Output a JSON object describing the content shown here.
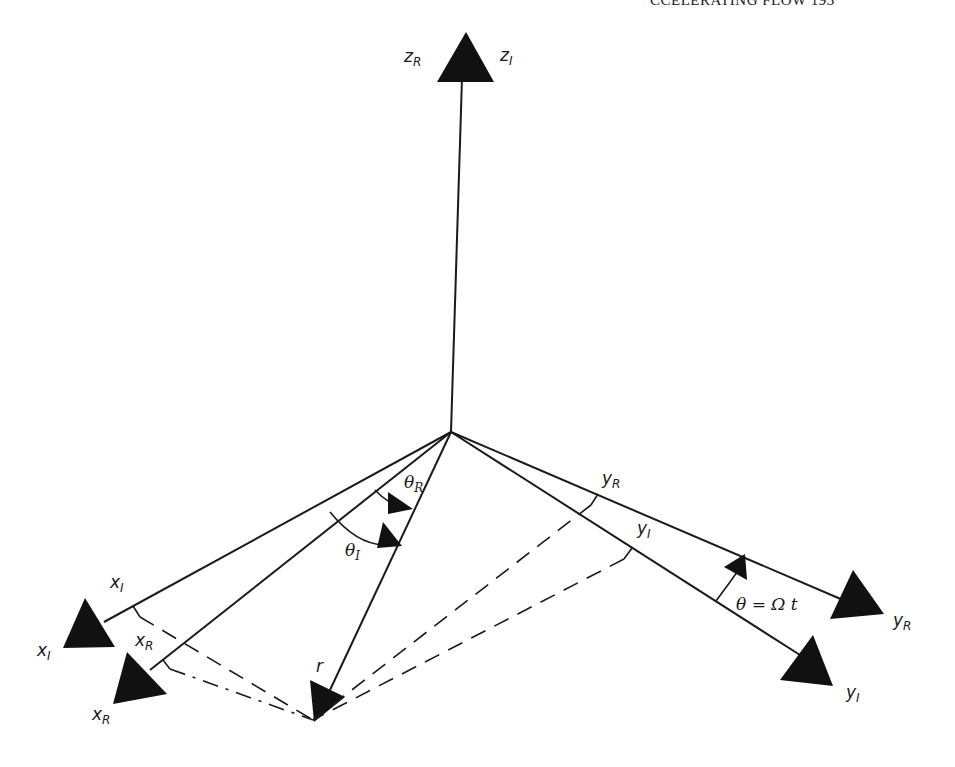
{
  "page_header": "CCELERATING FLOW 193",
  "labels": {
    "z_R": {
      "base": "z",
      "sub": "R"
    },
    "z_I": {
      "base": "z",
      "sub": "I"
    },
    "x_I_top": {
      "base": "x",
      "sub": "I"
    },
    "x_I_tip": {
      "base": "x",
      "sub": "I"
    },
    "x_R_top": {
      "base": "x",
      "sub": "R"
    },
    "x_R_tip": {
      "base": "x",
      "sub": "R"
    },
    "y_R_top": {
      "base": "y",
      "sub": "R"
    },
    "y_R_tip": {
      "base": "y",
      "sub": "R"
    },
    "y_I_top": {
      "base": "y",
      "sub": "I"
    },
    "y_I_tip": {
      "base": "y",
      "sub": "I"
    },
    "theta_R": {
      "base": "θ",
      "sub": "R"
    },
    "theta_I": {
      "base": "θ",
      "sub": "I"
    },
    "r": "r",
    "rotation_eq": "θ = Ω t"
  },
  "diagram": {
    "origin": [
      451,
      432
    ],
    "axes": [
      {
        "name": "z",
        "frames": [
          "R",
          "I"
        ],
        "tip": [
          466,
          32
        ]
      },
      {
        "name": "x_I",
        "tip": [
          75,
          640
        ]
      },
      {
        "name": "x_R",
        "tip": [
          125,
          688
        ]
      },
      {
        "name": "y_R",
        "tip": [
          875,
          615
        ]
      },
      {
        "name": "y_I",
        "tip": [
          828,
          684
        ]
      },
      {
        "name": "r",
        "tip": [
          313,
          690
        ]
      }
    ]
  }
}
